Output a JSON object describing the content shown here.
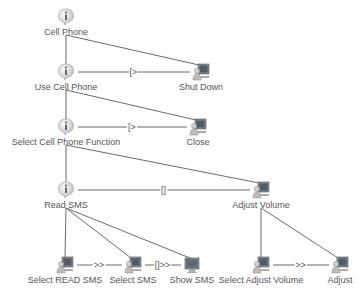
{
  "diagram": {
    "type": "task-model-tree",
    "nodes": [
      {
        "id": "cell_phone",
        "label": "Cell Phone",
        "kind": "abstract",
        "icon": "info-bubble-icon",
        "x": 66,
        "y": 17
      },
      {
        "id": "use_cell_phone",
        "label": "Use Cell Phone",
        "kind": "abstract",
        "icon": "info-bubble-icon",
        "x": 66,
        "y": 72
      },
      {
        "id": "shut_down",
        "label": "Shut Down",
        "kind": "interaction",
        "icon": "user-computer-icon",
        "x": 201,
        "y": 72
      },
      {
        "id": "select_function",
        "label": "Select Cell Phone Function",
        "kind": "abstract",
        "icon": "info-bubble-icon",
        "x": 66,
        "y": 127
      },
      {
        "id": "close",
        "label": "Close",
        "kind": "interaction",
        "icon": "user-computer-icon",
        "x": 198,
        "y": 127
      },
      {
        "id": "read_sms",
        "label": "Read SMS",
        "kind": "abstract",
        "icon": "info-bubble-icon",
        "x": 66,
        "y": 190
      },
      {
        "id": "adjust_volume",
        "label": "Adjust Volume",
        "kind": "interaction",
        "icon": "user-computer-icon",
        "x": 261,
        "y": 190
      },
      {
        "id": "select_read_sms",
        "label": "Select READ SMS",
        "kind": "interaction",
        "icon": "user-computer-icon",
        "x": 65,
        "y": 265
      },
      {
        "id": "select_sms",
        "label": "Select SMS",
        "kind": "interaction",
        "icon": "user-computer-icon",
        "x": 133,
        "y": 265
      },
      {
        "id": "show_sms",
        "label": "Show SMS",
        "kind": "application",
        "icon": "computer-icon",
        "x": 192,
        "y": 265
      },
      {
        "id": "select_adjust_volume",
        "label": "Select Adjust Volume",
        "kind": "interaction",
        "icon": "user-computer-icon",
        "x": 261,
        "y": 265
      },
      {
        "id": "adjust",
        "label": "Adjust",
        "kind": "interaction",
        "icon": "user-computer-icon",
        "x": 340,
        "y": 265
      }
    ],
    "hierarchy_edges": [
      {
        "from": "cell_phone",
        "to": "use_cell_phone"
      },
      {
        "from": "cell_phone",
        "to": "shut_down"
      },
      {
        "from": "use_cell_phone",
        "to": "select_function"
      },
      {
        "from": "use_cell_phone",
        "to": "close"
      },
      {
        "from": "select_function",
        "to": "read_sms"
      },
      {
        "from": "select_function",
        "to": "adjust_volume"
      },
      {
        "from": "read_sms",
        "to": "select_read_sms"
      },
      {
        "from": "read_sms",
        "to": "select_sms"
      },
      {
        "from": "read_sms",
        "to": "show_sms"
      },
      {
        "from": "adjust_volume",
        "to": "select_adjust_volume"
      },
      {
        "from": "adjust_volume",
        "to": "adjust"
      }
    ],
    "temporal_edges": [
      {
        "from": "use_cell_phone",
        "to": "shut_down",
        "operator": "[>"
      },
      {
        "from": "select_function",
        "to": "close",
        "operator": "[>"
      },
      {
        "from": "read_sms",
        "to": "adjust_volume",
        "operator": "[]"
      },
      {
        "from": "select_read_sms",
        "to": "select_sms",
        "operator": ">>"
      },
      {
        "from": "select_sms",
        "to": "show_sms",
        "operator": "[]>>"
      },
      {
        "from": "select_adjust_volume",
        "to": "adjust",
        "operator": ">>"
      }
    ],
    "colors": {
      "line": "#6b6b6b",
      "text": "#555555",
      "background": "#ffffff"
    }
  }
}
